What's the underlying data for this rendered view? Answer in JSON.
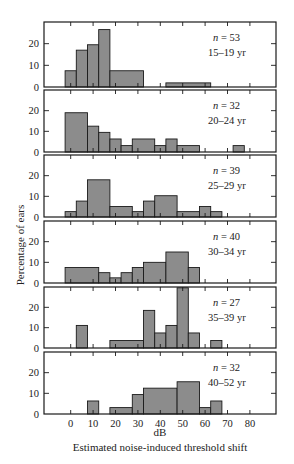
{
  "chart_data": {
    "type": "bar",
    "subtype": "stacked-panel histograms (step)",
    "title": "",
    "xlabel": "dB",
    "xlabel_sub": "Estimated noise-induced threshold shift",
    "ylabel": "Percentage of ears",
    "x_ticks": [
      0,
      10,
      20,
      30,
      40,
      50,
      60,
      70,
      80
    ],
    "xlim": [
      -20,
      90
    ],
    "bin_width": 5,
    "y_ticks": [
      0,
      10,
      20
    ],
    "ylim": [
      0,
      30
    ],
    "grid": false,
    "panels": [
      {
        "label_n": "n = 53",
        "label_age": "15–19 yr",
        "bins": [
          {
            "x0": -2.5,
            "x1": 2.5,
            "value": 7.5
          },
          {
            "x0": 2.5,
            "x1": 7.5,
            "value": 17
          },
          {
            "x0": 7.5,
            "x1": 12.5,
            "value": 19.5
          },
          {
            "x0": 12.5,
            "x1": 17.5,
            "value": 26.5
          },
          {
            "x0": 17.5,
            "x1": 32.5,
            "value": 7.5
          },
          {
            "x0": 42.5,
            "x1": 62.5,
            "value": 1.9
          }
        ]
      },
      {
        "label_n": "n = 32",
        "label_age": "20–24 yr",
        "bins": [
          {
            "x0": -2.5,
            "x1": 7.5,
            "value": 19
          },
          {
            "x0": 7.5,
            "x1": 12.5,
            "value": 12.5
          },
          {
            "x0": 12.5,
            "x1": 17.5,
            "value": 9.5
          },
          {
            "x0": 17.5,
            "x1": 22.5,
            "value": 6.3
          },
          {
            "x0": 22.5,
            "x1": 27.5,
            "value": 3.1
          },
          {
            "x0": 27.5,
            "x1": 37.5,
            "value": 6.3
          },
          {
            "x0": 37.5,
            "x1": 42.5,
            "value": 3.1
          },
          {
            "x0": 42.5,
            "x1": 47.5,
            "value": 6.3
          },
          {
            "x0": 47.5,
            "x1": 57.5,
            "value": 3.1
          },
          {
            "x0": 72.5,
            "x1": 77.5,
            "value": 3.1
          }
        ]
      },
      {
        "label_n": "n = 39",
        "label_age": "25–29 yr",
        "bins": [
          {
            "x0": -2.5,
            "x1": 2.5,
            "value": 2.6
          },
          {
            "x0": 2.5,
            "x1": 7.5,
            "value": 7.7
          },
          {
            "x0": 7.5,
            "x1": 17.5,
            "value": 18
          },
          {
            "x0": 17.5,
            "x1": 27.5,
            "value": 5.1
          },
          {
            "x0": 27.5,
            "x1": 32.5,
            "value": 2.6
          },
          {
            "x0": 32.5,
            "x1": 37.5,
            "value": 7.7
          },
          {
            "x0": 37.5,
            "x1": 47.5,
            "value": 10.3
          },
          {
            "x0": 47.5,
            "x1": 57.5,
            "value": 2.6
          },
          {
            "x0": 57.5,
            "x1": 62.5,
            "value": 5.1
          },
          {
            "x0": 62.5,
            "x1": 67.5,
            "value": 2.6
          }
        ]
      },
      {
        "label_n": "n = 40",
        "label_age": "30–34 yr",
        "bins": [
          {
            "x0": -2.5,
            "x1": 12.5,
            "value": 7.5
          },
          {
            "x0": 12.5,
            "x1": 17.5,
            "value": 5
          },
          {
            "x0": 17.5,
            "x1": 22.5,
            "value": 2.5
          },
          {
            "x0": 22.5,
            "x1": 27.5,
            "value": 5
          },
          {
            "x0": 27.5,
            "x1": 32.5,
            "value": 7.5
          },
          {
            "x0": 32.5,
            "x1": 42.5,
            "value": 10
          },
          {
            "x0": 42.5,
            "x1": 52.5,
            "value": 15
          },
          {
            "x0": 52.5,
            "x1": 57.5,
            "value": 7.5
          }
        ]
      },
      {
        "label_n": "n = 27",
        "label_age": "35–39 yr",
        "bins": [
          {
            "x0": 2.5,
            "x1": 7.5,
            "value": 11.1
          },
          {
            "x0": 17.5,
            "x1": 32.5,
            "value": 3.7
          },
          {
            "x0": 32.5,
            "x1": 37.5,
            "value": 18.5
          },
          {
            "x0": 37.5,
            "x1": 42.5,
            "value": 7.4
          },
          {
            "x0": 42.5,
            "x1": 47.5,
            "value": 11.1
          },
          {
            "x0": 47.5,
            "x1": 52.5,
            "value": 29.6
          },
          {
            "x0": 52.5,
            "x1": 57.5,
            "value": 7.4
          },
          {
            "x0": 62.5,
            "x1": 67.5,
            "value": 3.7
          }
        ]
      },
      {
        "label_n": "n = 32",
        "label_age": "40–52 yr",
        "bins": [
          {
            "x0": 7.5,
            "x1": 12.5,
            "value": 6.3
          },
          {
            "x0": 17.5,
            "x1": 27.5,
            "value": 3.1
          },
          {
            "x0": 27.5,
            "x1": 32.5,
            "value": 9.4
          },
          {
            "x0": 32.5,
            "x1": 47.5,
            "value": 12.5
          },
          {
            "x0": 47.5,
            "x1": 57.5,
            "value": 15.6
          },
          {
            "x0": 57.5,
            "x1": 62.5,
            "value": 3.1
          },
          {
            "x0": 62.5,
            "x1": 67.5,
            "value": 6.3
          }
        ]
      }
    ],
    "colors": {
      "bar_fill": "#8c8c8c",
      "line": "#1a1a1a",
      "background": "#ffffff"
    }
  }
}
